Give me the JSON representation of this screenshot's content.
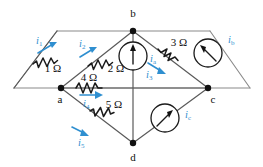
{
  "diagram": {
    "colors": {
      "wire": "#8a8a8a",
      "component": "#1a1a1a",
      "current_label": "#2f8fd0",
      "node": "#111111",
      "background": "#ffffff"
    },
    "nodes": [
      {
        "id": "b",
        "label": "b",
        "x": 133,
        "y": 31,
        "lx": 133,
        "ly": 15
      },
      {
        "id": "a",
        "label": "a",
        "x": 61,
        "y": 88,
        "lx": 60,
        "ly": 103
      },
      {
        "id": "c",
        "label": "c",
        "x": 208,
        "y": 88,
        "lx": 212,
        "ly": 103
      },
      {
        "id": "d",
        "label": "d",
        "x": 133,
        "y": 143,
        "lx": 133,
        "ly": 160
      }
    ],
    "resistors": [
      {
        "id": "r1",
        "label": "1 Ω",
        "value": 1,
        "unit": "Ω",
        "lx": 53,
        "ly": 63
      },
      {
        "id": "r2",
        "label": "2 Ω",
        "value": 2,
        "unit": "Ω",
        "lx": 113,
        "ly": 63
      },
      {
        "id": "r3",
        "label": "3 Ω",
        "value": 3,
        "unit": "Ω",
        "lx": 176,
        "ly": 48
      },
      {
        "id": "r4",
        "label": "4 Ω",
        "value": 4,
        "unit": "Ω",
        "lx": 89,
        "ly": 78
      },
      {
        "id": "r5",
        "label": "5 Ω",
        "value": 5,
        "unit": "Ω",
        "lx": 111,
        "ly": 110
      }
    ],
    "branch_currents": [
      {
        "id": "i1",
        "symbol": "i",
        "sub": "1",
        "lx": 40,
        "ly": 40
      },
      {
        "id": "i2",
        "symbol": "i",
        "sub": "2",
        "lx": 84,
        "ly": 42
      },
      {
        "id": "i3",
        "symbol": "i",
        "sub": "3",
        "lx": 151,
        "ly": 73
      },
      {
        "id": "i4",
        "symbol": "i",
        "sub": "4",
        "lx": 86,
        "ly": 101
      },
      {
        "id": "i5",
        "symbol": "i",
        "sub": "5",
        "lx": 82,
        "ly": 141
      }
    ],
    "sources": [
      {
        "id": "ia",
        "symbol": "i",
        "sub": "a",
        "cx": 133,
        "cy": 56,
        "r": 14,
        "lx": 149,
        "ly": 60
      },
      {
        "id": "ib",
        "symbol": "i",
        "sub": "b",
        "cx": 208,
        "cy": 53,
        "r": 14,
        "lx": 229,
        "ly": 41
      },
      {
        "id": "ic",
        "symbol": "i",
        "sub": "c",
        "cx": 165,
        "cy": 118,
        "r": 14,
        "lx": 186,
        "ly": 115
      }
    ]
  }
}
